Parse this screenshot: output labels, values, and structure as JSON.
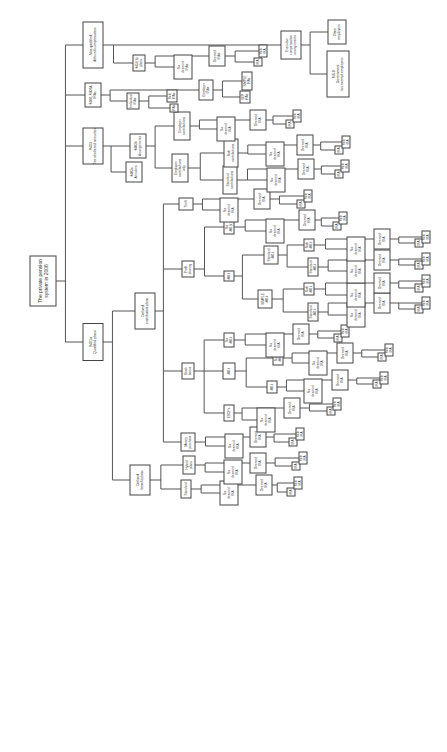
{
  "diagram": {
    "orientation": "rotated-90-ccw",
    "nodes": {
      "root": [
        "The private pension",
        "system in 2006"
      ],
      "q401a": [
        "§401a",
        "Qualified plans"
      ],
      "s403": [
        "§403",
        "Tax sheltered annuities"
      ],
      "s408": [
        "§408, §408A",
        "IRAs"
      ],
      "nqdc": [
        "Non-qualified",
        "deferred compensation"
      ],
      "dbp": [
        "Defined",
        "benefit plans"
      ],
      "dcp": [
        "Defined",
        "contribution plans"
      ],
      "db_std": [
        "Standard"
      ],
      "db_std_nd": [
        "No",
        "deemed",
        "IRA"
      ],
      "db_std_d": [
        "Deemed",
        "IRA"
      ],
      "db_std_i": [
        "IRA"
      ],
      "db_std_r": [
        "Roth",
        "IRA"
      ],
      "db_hyb": [
        "Hybrid",
        "plans"
      ],
      "db_hyb_nd": [
        "No",
        "deemed",
        "IRA"
      ],
      "db_hyb_d": [
        "Deemed",
        "IRA"
      ],
      "db_hyb_i": [
        "IRA"
      ],
      "db_hyb_r": [
        "Roth",
        "IRA"
      ],
      "mp": [
        "Money",
        "purchase"
      ],
      "mp_nd": [
        "No",
        "deemed",
        "IRA"
      ],
      "mp_d": [
        "Deemed",
        "IRA"
      ],
      "mp_i": [
        "IRA"
      ],
      "mp_r": [
        "Roth",
        "IRA"
      ],
      "sb": [
        "Stock",
        "bonus"
      ],
      "sb_esop": [
        "ESOPs"
      ],
      "sb_esop_nd": [
        "No",
        "deemed",
        "IRA"
      ],
      "sb_esop_d": [
        "Deemed",
        "IRA"
      ],
      "sb_esop_i": [
        "IRA"
      ],
      "sb_esop_r": [
        "Roth",
        "IRA"
      ],
      "sb_401k": [
        "401k"
      ],
      "sb_401k_a": [
        "401k"
      ],
      "sb_401k_a_nd": [
        "No",
        "deemed",
        "IRA"
      ],
      "sb_401k_a_d": [
        "Deemed",
        "IRA"
      ],
      "sb_401k_a_i": [
        "IRA"
      ],
      "sb_401k_a_r": [
        "Roth",
        "IRA"
      ],
      "sb_401k_b": [
        "Roth",
        "401k"
      ],
      "sb_401k_b_nd": [
        "No",
        "deemed",
        "IRA"
      ],
      "sb_401k_b_d": [
        "Deemed",
        "IRA"
      ],
      "sb_401k_b_i": [
        "IRA"
      ],
      "sb_401k_b_r": [
        "Roth",
        "IRA"
      ],
      "sb_no": [
        "No",
        "401k"
      ],
      "sb_no_nd": [
        "No",
        "deemed",
        "IRA"
      ],
      "sb_no_d": [
        "Deemed",
        "IRA"
      ],
      "sb_no_i": [
        "IRA"
      ],
      "sb_no_r": [
        "Roth",
        "IRA"
      ],
      "ps": [
        "Profit-",
        "sharing"
      ],
      "ps_401k": [
        "401k"
      ],
      "ps_simple": [
        "SIMPLE",
        "401k"
      ],
      "ps_std": [
        "Standard",
        "401k"
      ],
      "ps_s1": [
        "Standard",
        "401k"
      ],
      "ps_s1_nd": [
        "No",
        "deemed",
        "IRA"
      ],
      "ps_s1_d": [
        "Deemed",
        "IRA"
      ],
      "ps_s1_i": [
        "IRA"
      ],
      "ps_s1_r": [
        "Roth",
        "IRA"
      ],
      "ps_s2": [
        "Roth",
        "401k"
      ],
      "ps_s2_nd": [
        "No",
        "deemed",
        "IRA"
      ],
      "ps_s2_d": [
        "Deemed",
        "IRA"
      ],
      "ps_s2_i": [
        "IRA"
      ],
      "ps_s2_r": [
        "Roth",
        "IRA"
      ],
      "ps_t1": [
        "Standard",
        "401k"
      ],
      "ps_t1_nd": [
        "No",
        "deemed",
        "IRA"
      ],
      "ps_t1_d": [
        "Deemed",
        "IRA"
      ],
      "ps_t1_i": [
        "IRA"
      ],
      "ps_t1_r": [
        "Roth",
        "IRA"
      ],
      "ps_t2": [
        "Roth",
        "401k"
      ],
      "ps_t2_nd": [
        "No",
        "deemed",
        "IRA"
      ],
      "ps_t2_d": [
        "Deemed",
        "IRA"
      ],
      "ps_t2_i": [
        "IRA"
      ],
      "ps_t2_r": [
        "Roth",
        "IRA"
      ],
      "ps_no": [
        "No",
        "401(k)"
      ],
      "ps_no_nd": [
        "No",
        "deemed",
        "IRA"
      ],
      "ps_no_d": [
        "Deemed",
        "IRA"
      ],
      "ps_no_i": [
        "IRA"
      ],
      "ps_no_r": [
        "Roth",
        "IRA"
      ],
      "th": [
        "Thrift"
      ],
      "th_nd": [
        "No",
        "deemed",
        "IRA"
      ],
      "th_d": [
        "Deemed",
        "IRA"
      ],
      "th_i": [
        "IRA"
      ],
      "th_r": [
        "Roth",
        "IRA"
      ],
      "a403a": [
        "§403a",
        "Annuities"
      ],
      "a403b": [
        "§403b",
        "Arrangements"
      ],
      "eeonly": [
        "Employee",
        "contributions",
        "only"
      ],
      "std_c": [
        "Standard",
        "contributions"
      ],
      "std_c_nd": [
        "No",
        "deemed",
        "IRA"
      ],
      "std_c_d": [
        "Deemed",
        "IRA"
      ],
      "std_c_i": [
        "IRA"
      ],
      "std_c_r": [
        "Roth",
        "IRA"
      ],
      "roth_c": [
        "Roth",
        "contributions"
      ],
      "roth_c_nd": [
        "No",
        "deemed",
        "IRA"
      ],
      "roth_c_d": [
        "Deemed",
        "IRA"
      ],
      "roth_c_i": [
        "IRA"
      ],
      "roth_c_r": [
        "Roth",
        "IRA"
      ],
      "er_c": [
        "Employer",
        "contributions"
      ],
      "er_c_nd": [
        "No",
        "deemed",
        "IRA"
      ],
      "er_c_d": [
        "Deemed",
        "IRA"
      ],
      "er_c_i": [
        "IRA"
      ],
      "er_c_r": [
        "Roth",
        "IRA"
      ],
      "indiv": [
        "Individual",
        "IRAs"
      ],
      "indiv_i": [
        "IRAs"
      ],
      "indiv_r": [
        "Roth",
        "IRAs"
      ],
      "empira": [
        "Employer",
        "IRAs"
      ],
      "sep": [
        "SEP",
        "IRAs"
      ],
      "simple": [
        "SIMPLE",
        "IRAs"
      ],
      "s457b": [
        "§457(b)",
        "plans"
      ],
      "s457b_nd": [
        "No",
        "deemed",
        "IRAs"
      ],
      "s457b_d": [
        "Deemed",
        "IRAs"
      ],
      "s457b_i": [
        "IRA"
      ],
      "s457b_r": [
        "Roth",
        "IRA"
      ],
      "exec": [
        "Executive",
        "compensation",
        "arrangements"
      ],
      "gov": [
        "§457f",
        "Government",
        "tax exempt employers"
      ],
      "other": [
        "Other",
        "employers"
      ]
    }
  }
}
